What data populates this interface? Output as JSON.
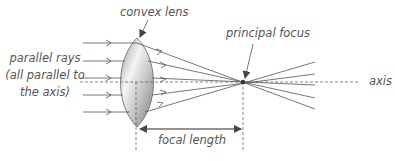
{
  "diagram": {
    "labels": {
      "lens": "convex lens",
      "focus": "principal focus",
      "rays_line1": "parallel rays",
      "rays_line2": "(all parallel to",
      "rays_line3": "the axis)",
      "axis": "axis",
      "focal_length": "focal length"
    },
    "colors": {
      "line": "#555555",
      "text": "#555555",
      "lens_light": "#f2f2f2",
      "lens_dark": "#8a8a8a"
    },
    "geometry": {
      "axis_y": 82,
      "lens_center_x": 137,
      "lens_top_y": 38,
      "lens_bottom_y": 127,
      "focus_x": 243,
      "ray_ys": [
        43,
        61,
        78,
        95,
        112
      ],
      "ray_count": 5
    }
  }
}
